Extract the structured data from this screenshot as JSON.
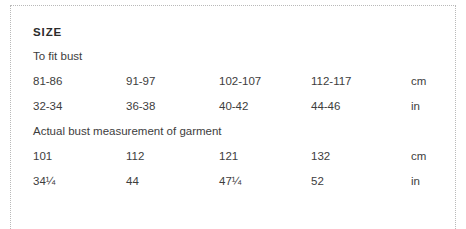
{
  "panel": {
    "title": "SIZE",
    "caption_to_fit": "To fit bust",
    "caption_actual": "Actual bust measurement of garment",
    "border_color": "#b9b9b9",
    "text_color": "#3d3d3d",
    "title_color": "#2b2b2b"
  },
  "table": {
    "to_fit_bust": {
      "label": "To fit bust",
      "rows": [
        {
          "values": [
            "81-86",
            "91-97",
            "102-107",
            "112-117"
          ],
          "unit": "cm"
        },
        {
          "values": [
            "32-34",
            "36-38",
            "40-42",
            "44-46"
          ],
          "unit": "in"
        }
      ]
    },
    "actual_bust": {
      "label": "Actual bust measurement of garment",
      "rows": [
        {
          "values": [
            "101",
            "112",
            "121",
            "132"
          ],
          "unit": "cm"
        },
        {
          "values": [
            "34¼",
            "44",
            "47¼",
            "52"
          ],
          "unit": "in"
        }
      ]
    }
  }
}
